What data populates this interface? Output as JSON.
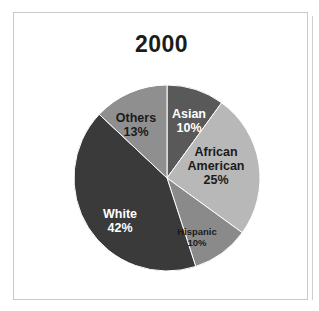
{
  "frame": {
    "border_color": "#c9c9c9",
    "background": "#ffffff"
  },
  "chart_data": {
    "type": "pie",
    "title": "2000",
    "xlabel": "",
    "ylabel": "",
    "legend_position": "none",
    "grid": false,
    "start_angle_deg": 0,
    "direction": "clockwise",
    "categories": [
      "Asian",
      "African American",
      "Hispanic",
      "White",
      "Others"
    ],
    "values": [
      10,
      25,
      10,
      42,
      13
    ],
    "value_suffix": "%",
    "slices": [
      {
        "label": "Asian",
        "value": 10,
        "value_text": "10%",
        "color": "#595959",
        "text_color": "#ffffff",
        "start_deg": 0,
        "end_deg": 36
      },
      {
        "label": "African American",
        "label_line1": "African",
        "label_line2": "American",
        "value": 25,
        "value_text": "25%",
        "color": "#b8b8b8",
        "text_color": "#1b1b1b",
        "start_deg": 36,
        "end_deg": 126
      },
      {
        "label": "Hispanic",
        "value": 10,
        "value_text": "10%",
        "color": "#8a8a8a",
        "text_color": "#1b1b1b",
        "start_deg": 126,
        "end_deg": 162
      },
      {
        "label": "White",
        "value": 42,
        "value_text": "42%",
        "color": "#3a3a3a",
        "text_color": "#ffffff",
        "start_deg": 162,
        "end_deg": 313.2
      },
      {
        "label": "Others",
        "value": 13,
        "value_text": "13%",
        "color": "#8f8f8f",
        "text_color": "#1b1b1b",
        "start_deg": 313.2,
        "end_deg": 360
      }
    ]
  }
}
